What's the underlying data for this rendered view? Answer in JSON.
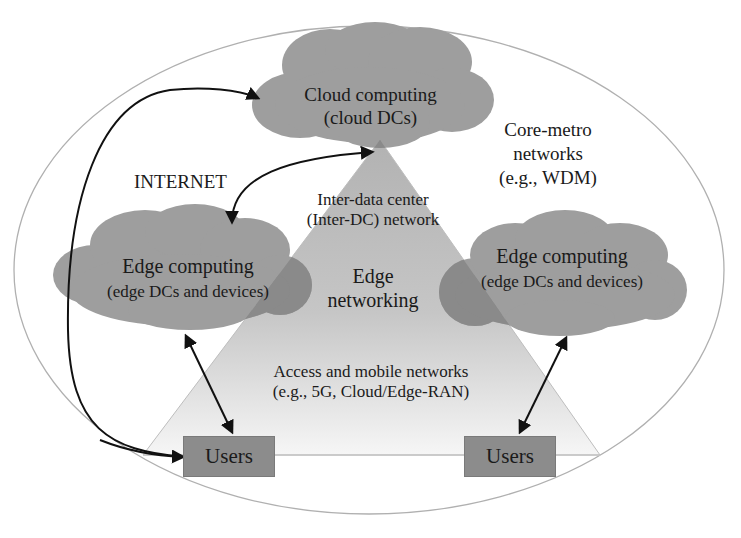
{
  "diagram": {
    "colors": {
      "cloud_fill": "#9e9e9e",
      "cloud_overlap_fill": "#8a8a8a",
      "triangle_fill_top": "#b4b4b4",
      "triangle_fill_bottom": "#f4f4f4",
      "ellipse_stroke": "#b0b0b0",
      "arrow_stroke": "#111111",
      "users_box_fill": "#8c8c8c"
    },
    "outer_region": {
      "label_line1": "Core-metro",
      "label_line2": "networks",
      "label_line3": "(e.g., WDM)"
    },
    "internet_label": "INTERNET",
    "cloud_top": {
      "title": "Cloud computing",
      "subtitle": "(cloud DCs)"
    },
    "edge_cloud_left": {
      "title": "Edge computing",
      "subtitle": "(edge DCs and devices)"
    },
    "edge_cloud_right": {
      "title": "Edge computing",
      "subtitle": "(edge DCs and devices)"
    },
    "triangle": {
      "inter_dc_line1": "Inter-data center",
      "inter_dc_line2": "(Inter-DC) network",
      "edge_net_line1": "Edge",
      "edge_net_line2": "networking",
      "access_line1": "Access and mobile networks",
      "access_line2": "(e.g., 5G, Cloud/Edge-RAN)"
    },
    "users_left": {
      "label": "Users"
    },
    "users_right": {
      "label": "Users"
    },
    "arrows": [
      {
        "from": "users_left",
        "to": "cloud_top",
        "type": "one-way-curved"
      },
      {
        "from": "edge_cloud_left",
        "to": "cloud_top",
        "type": "bidirectional-curved"
      },
      {
        "from": "edge_cloud_left",
        "to": "users_left",
        "type": "bidirectional"
      },
      {
        "from": "edge_cloud_right",
        "to": "users_right",
        "type": "bidirectional"
      }
    ]
  }
}
